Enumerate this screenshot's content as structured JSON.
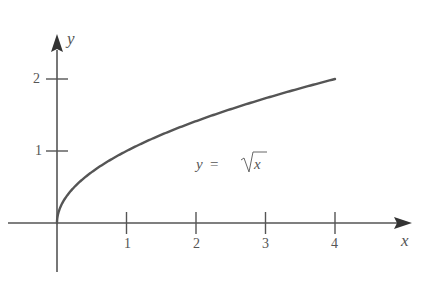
{
  "chart_data": {
    "type": "line",
    "title": "",
    "function": "y = sqrt(x)",
    "xlabel": "x",
    "ylabel": "y",
    "x_ticks": [
      1,
      2,
      3,
      4
    ],
    "y_ticks": [
      1,
      2
    ],
    "xlim": [
      -0.6,
      5.0
    ],
    "ylim": [
      -0.7,
      2.6
    ],
    "grid": false,
    "legend": null,
    "annotations": [
      {
        "text": "y = √x",
        "x": 2.4,
        "y": 1.15
      }
    ],
    "series": [
      {
        "name": "y = √x",
        "x": [
          0,
          0.0625,
          0.25,
          0.5,
          1,
          1.5,
          2,
          2.5,
          3,
          3.5,
          4
        ],
        "y": [
          0,
          0.25,
          0.5,
          0.707,
          1,
          1.225,
          1.414,
          1.581,
          1.732,
          1.871,
          2
        ]
      }
    ],
    "colors": {
      "curve": "#555555",
      "axes": "#555555",
      "text": "#555555"
    }
  },
  "labels": {
    "x_axis": "x",
    "y_axis": "y",
    "xtick_1": "1",
    "xtick_2": "2",
    "xtick_3": "3",
    "xtick_4": "4",
    "ytick_1": "1",
    "ytick_2": "2",
    "curve_label_lhs": "y",
    "curve_label_eq": "=",
    "curve_label_rhs": "x"
  }
}
